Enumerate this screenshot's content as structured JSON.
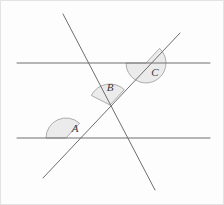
{
  "figure": {
    "name": "parallel-lines-transversals-angle-diagram",
    "width": 224,
    "height": 205,
    "background_color": "#fdfdfd",
    "border_color": "#e3e3e3",
    "line_color": "#6e6e6e",
    "line_width": 1,
    "angle_fill_color": "#ebebeb",
    "angle_stroke_color": "#9a9a9a",
    "label_color": "#3a3a3a",
    "label_font_size": 11
  },
  "lines": [
    {
      "id": "upper-parallel-line",
      "role": "horizontal-parallel",
      "x1": 17,
      "y1": 63,
      "x2": 210,
      "y2": 63
    },
    {
      "id": "lower-parallel-line",
      "role": "horizontal-parallel",
      "x1": 17,
      "y1": 138,
      "x2": 210,
      "y2": 138
    },
    {
      "id": "transversal-negative-slope",
      "role": "transversal",
      "x1": 63,
      "y1": 14,
      "x2": 155,
      "y2": 190
    },
    {
      "id": "transversal-positive-slope",
      "role": "transversal",
      "x1": 43,
      "y1": 178,
      "x2": 180,
      "y2": 33
    }
  ],
  "angles": [
    {
      "id": "angle-a",
      "label": "A",
      "vertex_x": 66,
      "vertex_y": 138,
      "radius": 20,
      "start_deg": 180,
      "end_deg": 313,
      "label_x": 75,
      "label_y": 129
    },
    {
      "id": "angle-b",
      "label": "B",
      "vertex_x": 110,
      "vertex_y": 105,
      "radius": 21,
      "start_deg": 207,
      "end_deg": 313,
      "label_x": 110,
      "label_y": 88
    },
    {
      "id": "angle-c",
      "label": "C",
      "vertex_x": 146,
      "vertex_y": 63,
      "radius": 20,
      "start_deg": 313,
      "end_deg": 180,
      "label_x": 155,
      "label_y": 73
    }
  ]
}
